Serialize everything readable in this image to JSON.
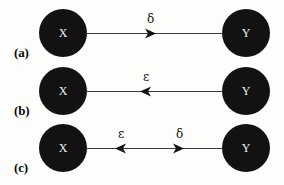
{
  "figure": {
    "background_color": "#fdfdfb",
    "node_color": "#121212",
    "node_text_color": "#f2f2f2",
    "line_color": "#3a3a3a",
    "rows": [
      {
        "label": "(a)",
        "source_node": "X",
        "target_node": "Y",
        "arrows": [
          {
            "symbol": "δ",
            "direction": "right"
          }
        ]
      },
      {
        "label": "(b)",
        "source_node": "X",
        "target_node": "Y",
        "arrows": [
          {
            "symbol": "ε",
            "direction": "left"
          }
        ]
      },
      {
        "label": "(c)",
        "source_node": "X",
        "target_node": "Y",
        "arrows": [
          {
            "symbol": "ε",
            "direction": "left"
          },
          {
            "symbol": "δ",
            "direction": "right"
          }
        ]
      }
    ]
  }
}
